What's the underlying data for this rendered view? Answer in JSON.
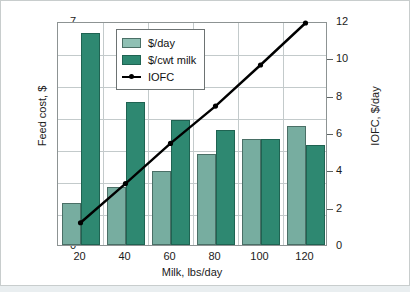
{
  "chart_data": {
    "type": "bar",
    "title": "",
    "xlabel": "Milk, lbs/day",
    "ylabel": "Feed cost, $",
    "ylabel_secondary": "IOFC, $/day",
    "categories": [
      "20",
      "40",
      "60",
      "80",
      "100",
      "120"
    ],
    "ylim": [
      0,
      7
    ],
    "ylim_secondary": [
      0,
      12
    ],
    "yticks": [
      "7",
      "6",
      "5",
      "4",
      "3",
      "2",
      "1",
      "0"
    ],
    "yticks_secondary": [
      "12",
      "10",
      "8",
      "6",
      "4",
      "2",
      "0"
    ],
    "grid": true,
    "legend_position": "upper-center",
    "series": [
      {
        "name": "$/day",
        "axis": "left",
        "type": "bar",
        "color": "#77ada0",
        "values": [
          1.3,
          1.8,
          2.3,
          2.85,
          3.3,
          3.73
        ]
      },
      {
        "name": "$/cwt milk",
        "axis": "left",
        "type": "bar",
        "color": "#2e8871",
        "values": [
          6.62,
          4.48,
          3.9,
          3.58,
          3.3,
          3.12
        ]
      },
      {
        "name": "IOFC",
        "axis": "right",
        "type": "line",
        "color": "#000000",
        "values": [
          1.3,
          3.4,
          5.55,
          7.55,
          9.75,
          12.0
        ]
      }
    ]
  }
}
